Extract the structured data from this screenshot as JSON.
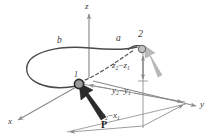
{
  "figure": {
    "type": "3d-mechanics-diagram",
    "colors": {
      "axis": "#8a8a8a",
      "member": "#4a4a4a",
      "dashed_chord": "#5a5a5a",
      "node_fill": "#9a9a9a",
      "node_stroke": "#2b2b2b",
      "force_arrow": "#2b2b2b",
      "reaction_arrow": "#b5b5b5",
      "dimension_line": "#8a8a8a",
      "text": "#3a3a3a"
    }
  },
  "axes": {
    "x": {
      "label": "x"
    },
    "y": {
      "label": "y"
    },
    "z": {
      "label": "z"
    }
  },
  "nodes": [
    {
      "id": "node-1",
      "label": "1"
    },
    {
      "id": "node-2",
      "label": "2"
    }
  ],
  "curve_labels": {
    "a": "a",
    "b": "b"
  },
  "force": {
    "label": "P"
  },
  "dimensions": [
    {
      "name": "delta-z",
      "v1": "z",
      "sub1": "2",
      "op": "−",
      "v2": "z",
      "sub2": "1"
    },
    {
      "name": "delta-y",
      "v1": "y",
      "sub1": "2",
      "op": "−",
      "v2": "y",
      "sub2": "1"
    },
    {
      "name": "delta-x",
      "v1": "x",
      "sub1": "2",
      "op": "−",
      "v2": "x",
      "sub2": "1"
    }
  ]
}
